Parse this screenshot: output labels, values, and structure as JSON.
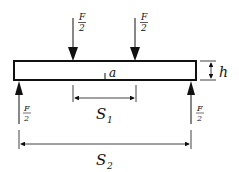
{
  "diagram": {
    "type": "four-point bending beam",
    "labels": {
      "load_top_left": {
        "num": "F",
        "den": "2"
      },
      "load_top_right": {
        "num": "F",
        "den": "2"
      },
      "support_left": {
        "num": "F",
        "den": "2"
      },
      "support_right": {
        "num": "F",
        "den": "2"
      },
      "crack": "a",
      "height": "h",
      "inner_span": "S",
      "inner_span_sub": "1",
      "outer_span": "S",
      "outer_span_sub": "2"
    },
    "colors": {
      "stroke": "#111111",
      "background": "#ffffff"
    }
  }
}
